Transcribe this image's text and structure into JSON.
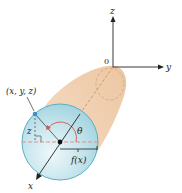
{
  "diagram": {
    "axes": {
      "z_label": "z",
      "y_label": "y",
      "x_label": "x",
      "origin_label": "0"
    },
    "point_label": "(x, y, z)",
    "height_label": "z",
    "angle_label": "θ",
    "radius_label": "f(x)",
    "colors": {
      "solid_fill": "#f2d6ba",
      "solid_edge": "#e3b48c",
      "disk_fill": "#bfe2ea",
      "disk_edge": "#5aaec3",
      "dashed_line": "#d9938f",
      "axis": "#222222",
      "point": "#3d8fd0",
      "angle_arc": "#d9534f"
    }
  }
}
